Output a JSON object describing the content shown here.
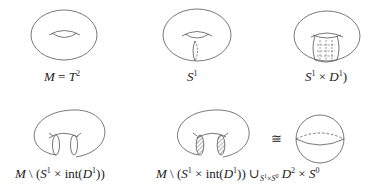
{
  "figures": [
    {
      "id": "torus",
      "label_parts": [
        "M",
        " = ",
        "T",
        "2"
      ],
      "label_html_key": "torus"
    },
    {
      "id": "circle-on-torus",
      "label_parts": [
        "S",
        "1"
      ]
    },
    {
      "id": "thickened-circle",
      "label_parts": [
        "S",
        "1",
        " × ",
        "D",
        "1",
        ")"
      ]
    },
    {
      "id": "torus-cut",
      "label_parts": [
        "M",
        " \\ (",
        "S",
        "1",
        " × int(",
        "D",
        "1",
        "))"
      ]
    },
    {
      "id": "torus-cut-capped",
      "label_parts": [
        "M",
        " \\ (",
        "S",
        "1",
        " × int(",
        "D",
        "1",
        ")) ∪",
        "S",
        "1",
        "×",
        "S",
        "0",
        " D",
        "2",
        " × ",
        "S",
        "0"
      ]
    }
  ],
  "relation_symbol": "≅",
  "labels": {
    "torus": {
      "a": "M",
      "b": " = ",
      "c": "T",
      "d": "2"
    },
    "circle": {
      "a": "S",
      "b": "1"
    },
    "thick": {
      "a": "S",
      "b": "1",
      "c": " × ",
      "d": "D",
      "e": "1",
      "f": ")"
    },
    "cut": {
      "a": "M",
      "b": " \\ (",
      "c": "S",
      "d": "1",
      "e": " × int(",
      "f": "D",
      "g": "1",
      "h": "))"
    },
    "capped": {
      "a": "M",
      "b": " \\ (",
      "c": "S",
      "d": "1",
      "e": " × int(",
      "f": "D",
      "g": "1",
      "h": ")) ∪",
      "i": "S",
      "j": "1",
      "k": "×",
      "l": "S",
      "m": "0",
      "n": " D",
      "o": "2",
      "p": " × ",
      "q": "S",
      "r": "0"
    }
  },
  "colors": {
    "stroke": "#555555",
    "text": "#222222"
  }
}
